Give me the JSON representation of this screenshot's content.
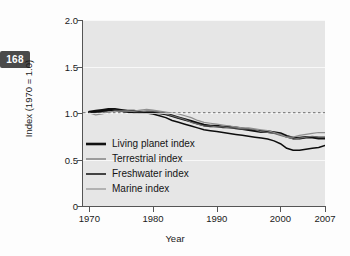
{
  "page_number": "168",
  "chart_data": {
    "type": "line",
    "title": "",
    "xlabel": "Year",
    "ylabel": "Index (1970 = 1.0)",
    "xlim": [
      1969,
      2007
    ],
    "ylim": [
      0,
      2.0
    ],
    "grid": true,
    "legend_position": "inside-lower-left",
    "x_ticks": [
      "1970",
      "1980",
      "1990",
      "2000",
      "2007"
    ],
    "x_tick_values": [
      1970,
      1980,
      1990,
      2000,
      2007
    ],
    "y_ticks": [
      "2.0",
      "1.5",
      "1.0",
      "0.5",
      "0"
    ],
    "y_tick_values": [
      2.0,
      1.5,
      1.0,
      0.5,
      0
    ],
    "reference_line": {
      "value": 1.0,
      "style": "dashed",
      "color": "#222222"
    },
    "x": [
      1970,
      1971,
      1972,
      1973,
      1974,
      1975,
      1976,
      1977,
      1978,
      1979,
      1980,
      1981,
      1982,
      1983,
      1984,
      1985,
      1986,
      1987,
      1988,
      1989,
      1990,
      1991,
      1992,
      1993,
      1994,
      1995,
      1996,
      1997,
      1998,
      1999,
      2000,
      2001,
      2002,
      2003,
      2004,
      2005,
      2006,
      2007
    ],
    "series": [
      {
        "name": "Living planet index",
        "color": "#111111",
        "width": 2.6,
        "values": [
          1.01,
          1.02,
          1.03,
          1.04,
          1.04,
          1.03,
          1.02,
          1.02,
          1.01,
          1.01,
          1.01,
          1.0,
          0.99,
          0.97,
          0.95,
          0.93,
          0.91,
          0.89,
          0.87,
          0.86,
          0.86,
          0.85,
          0.85,
          0.84,
          0.83,
          0.82,
          0.81,
          0.8,
          0.8,
          0.79,
          0.78,
          0.75,
          0.73,
          0.73,
          0.74,
          0.74,
          0.73,
          0.73
        ]
      },
      {
        "name": "Terrestrial index",
        "color": "#6b6b6b",
        "width": 1.2,
        "values": [
          1.0,
          1.0,
          1.01,
          1.02,
          1.03,
          1.02,
          1.02,
          1.01,
          1.01,
          1.02,
          1.02,
          1.01,
          0.99,
          0.97,
          0.95,
          0.93,
          0.9,
          0.88,
          0.86,
          0.86,
          0.85,
          0.85,
          0.84,
          0.84,
          0.83,
          0.83,
          0.82,
          0.8,
          0.79,
          0.78,
          0.76,
          0.74,
          0.72,
          0.73,
          0.74,
          0.75,
          0.74,
          0.74
        ]
      },
      {
        "name": "Freshwater index",
        "color": "#0d0d0d",
        "width": 1.5,
        "values": [
          1.01,
          1.01,
          1.02,
          1.03,
          1.03,
          1.02,
          1.01,
          1.0,
          1.0,
          1.0,
          0.99,
          0.97,
          0.95,
          0.92,
          0.9,
          0.88,
          0.86,
          0.84,
          0.82,
          0.81,
          0.8,
          0.79,
          0.78,
          0.77,
          0.76,
          0.75,
          0.74,
          0.73,
          0.72,
          0.7,
          0.67,
          0.62,
          0.6,
          0.6,
          0.61,
          0.62,
          0.63,
          0.65
        ]
      },
      {
        "name": "Marine index",
        "color": "#8f8f8f",
        "width": 1.2,
        "values": [
          1.0,
          0.98,
          0.99,
          1.01,
          1.02,
          1.02,
          1.02,
          1.02,
          1.03,
          1.04,
          1.03,
          1.02,
          1.01,
          1.0,
          0.99,
          0.97,
          0.95,
          0.92,
          0.9,
          0.89,
          0.88,
          0.87,
          0.86,
          0.85,
          0.84,
          0.84,
          0.83,
          0.82,
          0.81,
          0.79,
          0.77,
          0.74,
          0.74,
          0.76,
          0.77,
          0.78,
          0.79,
          0.79
        ]
      }
    ]
  }
}
